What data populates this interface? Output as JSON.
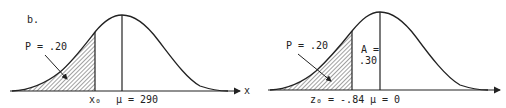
{
  "panel_label": "b.",
  "left": {
    "p_label": "P = .20",
    "x0_label": "x₀",
    "mu_label": "μ = 290",
    "axis_label": "x"
  },
  "right": {
    "p_label": "P = .20",
    "a_label_line1": "A =",
    "a_label_line2": ".30",
    "z0_label": "z₀ = -.84",
    "mu_label": "μ = 0"
  },
  "colors": {
    "ink": "#222222",
    "background": "#ffffff"
  }
}
